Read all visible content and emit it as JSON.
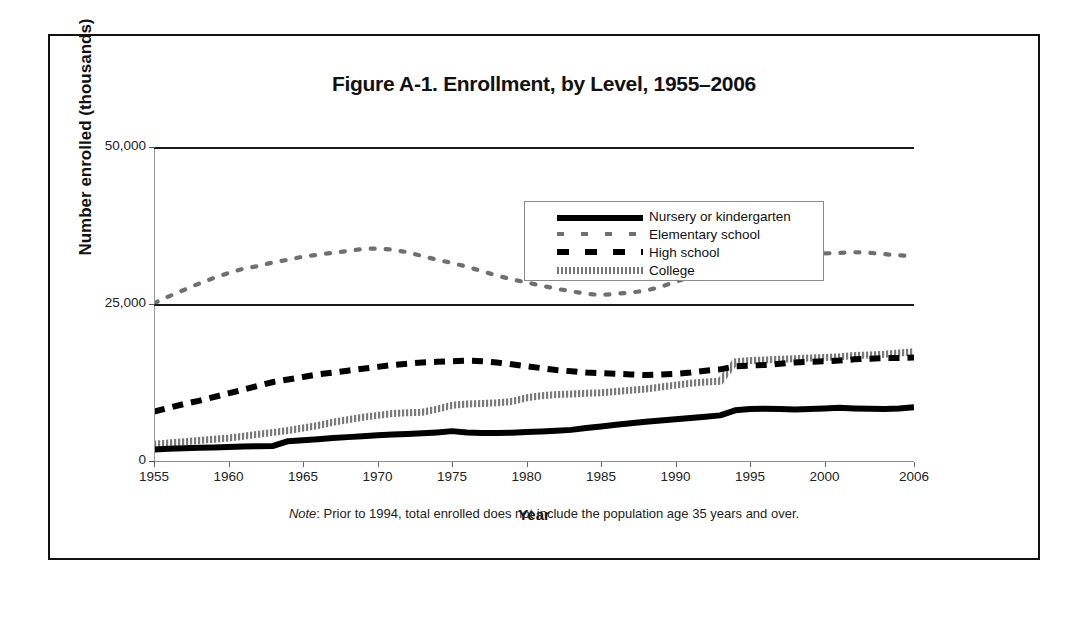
{
  "figure": {
    "title": "Figure A-1. Enrollment, by Level, 1955–2006",
    "note_prefix": "Note",
    "note_text": ": Prior to 1994, total enrolled does not include the population age 35 years and over."
  },
  "axes": {
    "y_title": "Number enrolled (thousands)",
    "x_title": "Year",
    "y_ticks": [
      "0",
      "25,000",
      "50,000"
    ],
    "y_tick_0": "0",
    "y_tick_25000": "25,000",
    "y_tick_50000": "50,000",
    "x_ticks": [
      "1955",
      "1960",
      "1965",
      "1970",
      "1975",
      "1980",
      "1985",
      "1990",
      "1995",
      "2000",
      "2006"
    ]
  },
  "legend": {
    "items": [
      {
        "label": "Nursery or kindergarten",
        "style": "thick-solid",
        "color": "#000000"
      },
      {
        "label": "Elementary school",
        "style": "sparse-dotted",
        "color": "#6f6f6f"
      },
      {
        "label": "High school",
        "style": "dashed",
        "color": "#000000"
      },
      {
        "label": "College",
        "style": "hatched",
        "color": "#777777"
      }
    ]
  },
  "chart_data": {
    "type": "line",
    "title": "Figure A-1. Enrollment, by Level, 1955–2006",
    "xlabel": "Year",
    "ylabel": "Number enrolled (thousands)",
    "xlim": [
      1955,
      2006
    ],
    "ylim": [
      0,
      50000
    ],
    "yticks": [
      0,
      25000,
      50000
    ],
    "xticks": [
      1955,
      1960,
      1965,
      1970,
      1975,
      1980,
      1985,
      1990,
      1995,
      2000,
      2006
    ],
    "grid": false,
    "legend_position": "upper-center",
    "annotations": [
      "Prior to 1994, total enrolled does not include the population age 35 years and over."
    ],
    "x": [
      1955,
      1956,
      1957,
      1958,
      1959,
      1960,
      1961,
      1962,
      1963,
      1964,
      1965,
      1966,
      1967,
      1968,
      1969,
      1970,
      1971,
      1972,
      1973,
      1974,
      1975,
      1976,
      1977,
      1978,
      1979,
      1980,
      1981,
      1982,
      1983,
      1984,
      1985,
      1986,
      1987,
      1988,
      1989,
      1990,
      1991,
      1992,
      1993,
      1994,
      1995,
      1996,
      1997,
      1998,
      1999,
      2000,
      2001,
      2002,
      2003,
      2004,
      2005,
      2006
    ],
    "series": [
      {
        "name": "Nursery or kindergarten",
        "style": "thick-solid",
        "color": "#000000",
        "values": [
          2000,
          2100,
          2200,
          2250,
          2300,
          2400,
          2450,
          2500,
          2550,
          3300,
          3450,
          3600,
          3800,
          3950,
          4100,
          4250,
          4350,
          4450,
          4550,
          4700,
          4900,
          4700,
          4600,
          4600,
          4650,
          4750,
          4850,
          4950,
          5100,
          5400,
          5650,
          5900,
          6150,
          6400,
          6600,
          6800,
          7000,
          7200,
          7400,
          8200,
          8400,
          8450,
          8400,
          8350,
          8400,
          8500,
          8600,
          8500,
          8450,
          8400,
          8500,
          8700
        ]
      },
      {
        "name": "Elementary school",
        "style": "sparse-dotted",
        "color": "#6f6f6f",
        "values": [
          25200,
          26300,
          27300,
          28300,
          29200,
          30000,
          30700,
          31100,
          31700,
          32100,
          32600,
          32900,
          33200,
          33500,
          33800,
          33900,
          33700,
          33300,
          32700,
          32100,
          31600,
          31000,
          30300,
          29600,
          29000,
          28500,
          28000,
          27500,
          27100,
          26700,
          26500,
          26700,
          26900,
          27200,
          27800,
          28600,
          29400,
          30100,
          30700,
          31500,
          32000,
          32400,
          32700,
          32900,
          33000,
          33100,
          33200,
          33300,
          33200,
          33000,
          32800,
          32700
        ]
      },
      {
        "name": "High school",
        "style": "dashed",
        "color": "#000000",
        "values": [
          8000,
          8600,
          9200,
          9700,
          10300,
          10900,
          11500,
          12100,
          12700,
          13100,
          13500,
          13900,
          14200,
          14500,
          14800,
          15100,
          15400,
          15600,
          15800,
          15900,
          16000,
          16100,
          16000,
          15800,
          15500,
          15200,
          14900,
          14600,
          14400,
          14200,
          14100,
          14000,
          13900,
          13800,
          13900,
          14000,
          14200,
          14500,
          14700,
          15200,
          15300,
          15400,
          15600,
          15800,
          15900,
          16000,
          16100,
          16300,
          16400,
          16500,
          16500,
          16600
        ]
      },
      {
        "name": "College",
        "style": "hatched",
        "color": "#777777",
        "values": [
          2800,
          3000,
          3200,
          3400,
          3600,
          3800,
          4100,
          4400,
          4700,
          5000,
          5400,
          5800,
          6300,
          6700,
          7100,
          7400,
          7700,
          7800,
          7900,
          8400,
          9000,
          9200,
          9300,
          9400,
          9600,
          10200,
          10500,
          10700,
          10800,
          10900,
          11000,
          11200,
          11400,
          11600,
          11900,
          12200,
          12500,
          12700,
          12800,
          15900,
          16100,
          16200,
          16300,
          16400,
          16500,
          16600,
          16700,
          16900,
          17000,
          17100,
          17300,
          17500
        ]
      }
    ]
  }
}
